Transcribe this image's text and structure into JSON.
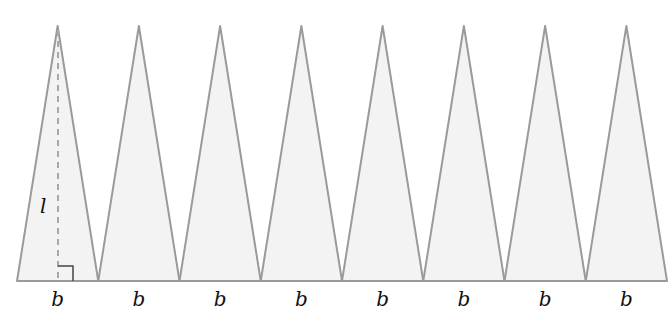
{
  "diagram": {
    "triangle_count": 8,
    "base_labels": [
      "b",
      "b",
      "b",
      "b",
      "b",
      "b",
      "b",
      "b"
    ],
    "height_label": "l",
    "right_angle_marker": true,
    "colors": {
      "fill": "#f3f3f3",
      "stroke": "#9a9a9a",
      "dashed": "#a8a8a8",
      "marker": "#444444",
      "text": "#111111"
    },
    "geometry": {
      "baseline_y": 281,
      "apex_y": 26,
      "x_start": 17,
      "x_end": 667
    }
  }
}
